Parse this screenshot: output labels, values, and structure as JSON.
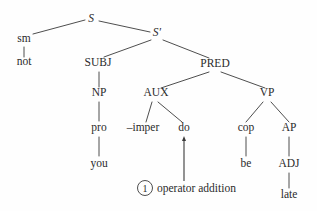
{
  "diagram": {
    "type": "syntax-tree",
    "title": "",
    "background_color": "#fefefe",
    "line_color": "#3a3a3a",
    "text_color": "#2b2b2b",
    "nodes": [
      {
        "id": "s",
        "label": "S",
        "x": 91,
        "y": 22,
        "style": "italic"
      },
      {
        "id": "sm",
        "label": "sm",
        "x": 24,
        "y": 42,
        "style": "roman"
      },
      {
        "id": "not",
        "label": "not",
        "x": 24,
        "y": 65,
        "style": "roman"
      },
      {
        "id": "sbar",
        "label": "S′",
        "x": 157,
        "y": 36,
        "style": "italic"
      },
      {
        "id": "subj",
        "label": "SUBJ",
        "x": 98,
        "y": 66,
        "style": "roman"
      },
      {
        "id": "pred",
        "label": "PRED",
        "x": 215,
        "y": 67,
        "style": "roman"
      },
      {
        "id": "np",
        "label": "NP",
        "x": 99,
        "y": 96,
        "style": "roman"
      },
      {
        "id": "aux",
        "label": "AUX",
        "x": 156,
        "y": 96,
        "style": "roman"
      },
      {
        "id": "vp",
        "label": "VP",
        "x": 267,
        "y": 96,
        "style": "roman"
      },
      {
        "id": "pro",
        "label": "pro",
        "x": 99,
        "y": 131,
        "style": "roman"
      },
      {
        "id": "imper",
        "label": "–imper",
        "x": 143,
        "y": 131,
        "style": "roman"
      },
      {
        "id": "do",
        "label": "do",
        "x": 184,
        "y": 131,
        "style": "roman"
      },
      {
        "id": "cop",
        "label": "cop",
        "x": 246,
        "y": 131,
        "style": "roman"
      },
      {
        "id": "ap",
        "label": "AP",
        "x": 289,
        "y": 131,
        "style": "roman"
      },
      {
        "id": "you",
        "label": "you",
        "x": 99,
        "y": 167,
        "style": "roman"
      },
      {
        "id": "be",
        "label": "be",
        "x": 246,
        "y": 167,
        "style": "roman"
      },
      {
        "id": "adj",
        "label": "ADJ",
        "x": 289,
        "y": 167,
        "style": "roman"
      },
      {
        "id": "late",
        "label": "late",
        "x": 289,
        "y": 198,
        "style": "roman"
      }
    ],
    "edges": [
      {
        "from": "s",
        "to": "sm",
        "x1": 85,
        "y1": 20,
        "x2": 33,
        "y2": 34
      },
      {
        "from": "s",
        "to": "sbar",
        "x1": 99,
        "y1": 21,
        "x2": 150,
        "y2": 32
      },
      {
        "from": "sm",
        "to": "not",
        "x1": 24,
        "y1": 47,
        "x2": 24,
        "y2": 57
      },
      {
        "from": "sbar",
        "to": "subj",
        "x1": 151,
        "y1": 40,
        "x2": 104,
        "y2": 57
      },
      {
        "from": "sbar",
        "to": "pred",
        "x1": 163,
        "y1": 40,
        "x2": 209,
        "y2": 58
      },
      {
        "from": "subj",
        "to": "np",
        "x1": 99,
        "y1": 72,
        "x2": 99,
        "y2": 87
      },
      {
        "from": "pred",
        "to": "aux",
        "x1": 209,
        "y1": 72,
        "x2": 161,
        "y2": 88
      },
      {
        "from": "pred",
        "to": "vp",
        "x1": 221,
        "y1": 72,
        "x2": 265,
        "y2": 88
      },
      {
        "from": "np",
        "to": "pro",
        "x1": 99,
        "y1": 102,
        "x2": 99,
        "y2": 121
      },
      {
        "from": "aux",
        "to": "imper",
        "x1": 152,
        "y1": 102,
        "x2": 146,
        "y2": 122
      },
      {
        "from": "aux",
        "to": "do",
        "x1": 158,
        "y1": 102,
        "x2": 182,
        "y2": 122
      },
      {
        "from": "vp",
        "to": "cop",
        "x1": 263,
        "y1": 102,
        "x2": 246,
        "y2": 122
      },
      {
        "from": "vp",
        "to": "ap",
        "x1": 271,
        "y1": 102,
        "x2": 289,
        "y2": 122
      },
      {
        "from": "pro",
        "to": "you",
        "x1": 99,
        "y1": 137,
        "x2": 99,
        "y2": 156
      },
      {
        "from": "cop",
        "to": "be",
        "x1": 246,
        "y1": 137,
        "x2": 246,
        "y2": 156
      },
      {
        "from": "ap",
        "to": "adj",
        "x1": 289,
        "y1": 137,
        "x2": 289,
        "y2": 156
      },
      {
        "from": "adj",
        "to": "late",
        "x1": 289,
        "y1": 173,
        "x2": 289,
        "y2": 188
      }
    ],
    "annotation": {
      "number": "1",
      "label": "operator addition",
      "circle": {
        "cx": 145,
        "cy": 188,
        "r": 7.5
      },
      "label_x": 157,
      "label_y": 192,
      "arrow": {
        "from_x": 184,
        "from_y": 181,
        "to_x": 184,
        "to_y": 136,
        "head_width": 4,
        "head_height": 5
      }
    }
  }
}
